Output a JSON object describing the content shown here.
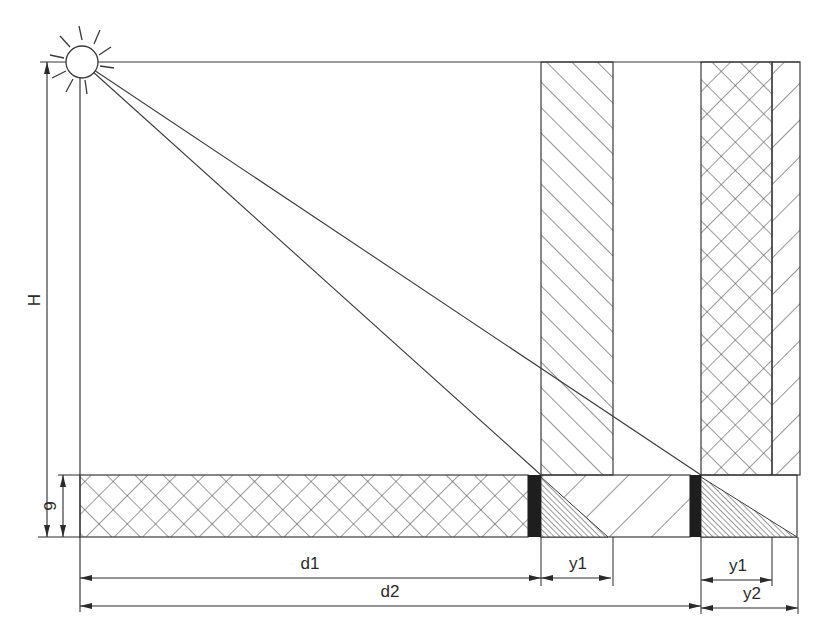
{
  "figure": {
    "colors": {
      "stroke": "#3a3a3a",
      "fill_black": "#1e1e1e",
      "background": "#ffffff"
    }
  },
  "light_source": {
    "icon": "sun-icon",
    "cx": 82,
    "cy": 62,
    "r": 16
  },
  "labels": {
    "height": "H",
    "ground_height": "9",
    "d1": "d1",
    "d2": "d2",
    "y1_left": "y1",
    "y1_right": "y1",
    "y2": "y2"
  },
  "elements": {
    "ground_band": {
      "x1": 80,
      "x2": 797,
      "y1": 475,
      "y2": 537,
      "pattern": "crosshatch"
    },
    "obstruction_1": {
      "x1": 541,
      "x2": 613,
      "y1": 62,
      "y2": 475,
      "pattern": "diagonal-forward"
    },
    "obstruction_2": {
      "x1": 701,
      "x2": 772,
      "y1": 62,
      "y2": 475,
      "pattern": "crosshatch"
    },
    "obstruction_2_edge": {
      "x1": 772,
      "x2": 800,
      "y1": 62,
      "y2": 475,
      "pattern": "diagonal-back"
    },
    "black_bar_1": {
      "x1": 528,
      "x2": 541,
      "y1": 475,
      "y2": 537
    },
    "black_bar_2": {
      "x1": 690,
      "x2": 701,
      "y1": 475,
      "y2": 537
    },
    "shadow_1": {
      "x_start": 541,
      "x_end": 608
    },
    "shadow_2": {
      "x_start": 701,
      "x_end": 797
    },
    "rays": [
      {
        "from": [
          82,
          62
        ],
        "to": [
          541,
          475
        ]
      },
      {
        "from": [
          82,
          62
        ],
        "to": [
          701,
          475
        ]
      }
    ]
  },
  "dimensions": [
    {
      "name": "H",
      "axis": "vertical",
      "x": 47,
      "from": 62,
      "to": 537
    },
    {
      "name": "9",
      "axis": "vertical",
      "x": 62,
      "from": 475,
      "to": 537
    },
    {
      "name": "d1",
      "axis": "horizontal",
      "y": 578,
      "from": 80,
      "to": 541
    },
    {
      "name": "y1",
      "axis": "horizontal",
      "y": 578,
      "from": 541,
      "to": 613
    },
    {
      "name": "d2",
      "axis": "horizontal",
      "y": 606,
      "from": 80,
      "to": 701
    },
    {
      "name": "y1",
      "axis": "horizontal",
      "y": 578,
      "from": 701,
      "to": 772
    },
    {
      "name": "y2",
      "axis": "horizontal",
      "y": 606,
      "from": 701,
      "to": 800
    }
  ]
}
